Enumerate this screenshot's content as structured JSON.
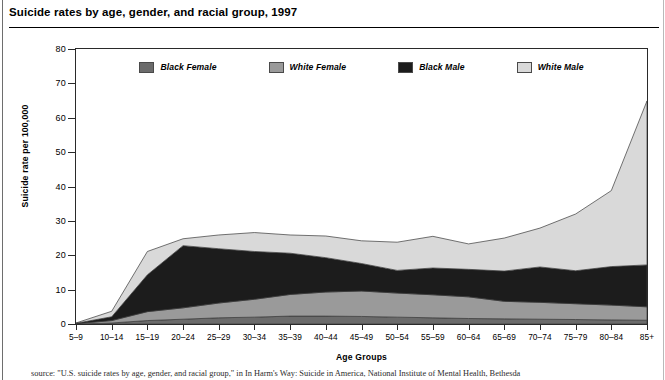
{
  "title": "Suicide rates by age, gender, and racial group, 1997",
  "footer_source": "source: \"U.S. suicide rates by age, gender, and racial group,\" in In Harm's Way: Suicide in America, National Institute of Mental Health, Bethesda",
  "legend": {
    "items": [
      {
        "label": "Black Female",
        "color": "#6b6b6b",
        "name": "black-female"
      },
      {
        "label": "White Female",
        "color": "#9a9a9a",
        "name": "white-female"
      },
      {
        "label": "Black Male",
        "color": "#1c1c1c",
        "name": "black-male"
      },
      {
        "label": "White Male",
        "color": "#d9d9d9",
        "name": "white-male"
      }
    ]
  },
  "axes": {
    "y_title": "Suicide rate per 100,000",
    "x_title": "Age Groups",
    "y_ticks": [
      "0",
      "10",
      "20",
      "30",
      "40",
      "50",
      "60",
      "70",
      "80"
    ]
  },
  "chart_data": {
    "type": "area",
    "stacked": true,
    "title": "Suicide rates by age, gender, and racial group, 1997",
    "xlabel": "Age Groups",
    "ylabel": "Suicide rate per 100,000",
    "ylim": [
      0,
      80
    ],
    "ytick_step": 10,
    "grid": false,
    "legend_position": "top-inside",
    "categories": [
      "5–9",
      "10–14",
      "15–19",
      "20–24",
      "25–29",
      "30–34",
      "35–39",
      "40–44",
      "45–49",
      "50–54",
      "55–59",
      "60–64",
      "65–69",
      "70–74",
      "75–79",
      "80–84",
      "85+"
    ],
    "series": [
      {
        "name": "Black Female",
        "color": "#6b6b6b",
        "values": [
          0.0,
          0.3,
          1.0,
          1.4,
          1.8,
          2.0,
          2.3,
          2.3,
          2.2,
          2.0,
          1.8,
          1.6,
          1.5,
          1.4,
          1.3,
          1.2,
          1.1
        ]
      },
      {
        "name": "White Female",
        "color": "#9a9a9a",
        "values": [
          0.1,
          0.7,
          2.6,
          3.3,
          4.3,
          5.2,
          6.3,
          7.0,
          7.4,
          7.0,
          6.7,
          6.3,
          5.1,
          4.9,
          4.6,
          4.3,
          3.9
        ]
      },
      {
        "name": "Black Male",
        "color": "#1c1c1c",
        "values": [
          0.1,
          1.1,
          10.7,
          18.1,
          15.8,
          13.9,
          12.0,
          10.0,
          8.0,
          6.6,
          7.8,
          8.0,
          8.8,
          10.3,
          9.6,
          11.2,
          12.2
        ]
      },
      {
        "name": "White Male",
        "color": "#d9d9d9",
        "values": [
          0.1,
          1.6,
          6.8,
          2.0,
          4.0,
          5.5,
          5.3,
          6.3,
          6.6,
          8.2,
          9.2,
          7.4,
          9.6,
          11.3,
          16.5,
          22.1,
          47.7
        ]
      }
    ],
    "series_totals": [
      0.3,
      3.7,
      21.1,
      24.8,
      25.9,
      26.6,
      25.9,
      25.6,
      24.2,
      23.8,
      25.5,
      23.3,
      25.0,
      27.9,
      32.0,
      38.8,
      64.9
    ]
  }
}
